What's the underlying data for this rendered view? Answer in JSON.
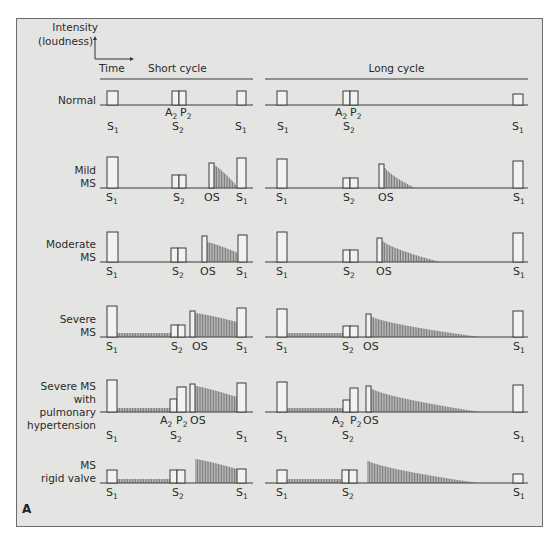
{
  "figure": {
    "panel_letter": "A",
    "axis_legend": {
      "y_label_line1": "Intensity",
      "y_label_line2": "(loudness)",
      "x_label": "Time"
    },
    "columns": [
      {
        "title": "Short cycle",
        "x0": 100,
        "x1": 253
      },
      {
        "title": "Long cycle",
        "x0": 265,
        "x1": 528
      }
    ],
    "colors": {
      "panel_bg": "#e4e4e2",
      "line": "#3a3a3a",
      "murmur": "#555555",
      "box_fill": "#f2f2f0"
    }
  },
  "chart_data": {
    "type": "diagram",
    "rows": [
      {
        "label": [
          "Normal"
        ],
        "baseline": 105,
        "short": {
          "boxes": [
            [
              107,
              118,
              14
            ],
            [
              172,
              179,
              14
            ],
            [
              179,
              186,
              14
            ],
            [
              237,
              246,
              14
            ]
          ],
          "murmurs": [],
          "marks": [
            {
              "t": "S",
              "s": "1",
              "x": 107,
              "dy": 25
            },
            {
              "t": "A",
              "s": "2",
              "x": 165,
              "dy": 11
            },
            {
              "t": "P",
              "s": "2",
              "x": 180,
              "dy": 11
            },
            {
              "t": "S",
              "s": "2",
              "x": 172,
              "dy": 25
            },
            {
              "t": "S",
              "s": "1",
              "x": 235,
              "dy": 25
            }
          ]
        },
        "long": {
          "boxes": [
            [
              277,
              287,
              14
            ],
            [
              343,
              350,
              14
            ],
            [
              350,
              358,
              14
            ],
            [
              513,
              523,
              11
            ]
          ],
          "murmurs": [],
          "marks": [
            {
              "t": "S",
              "s": "1",
              "x": 277,
              "dy": 25
            },
            {
              "t": "A",
              "s": "2",
              "x": 335,
              "dy": 11
            },
            {
              "t": "P",
              "s": "2",
              "x": 350,
              "dy": 11
            },
            {
              "t": "S",
              "s": "2",
              "x": 343,
              "dy": 25
            },
            {
              "t": "S",
              "s": "1",
              "x": 512,
              "dy": 25
            }
          ]
        }
      },
      {
        "label": [
          "Mild",
          "MS"
        ],
        "baseline": 188,
        "short": {
          "boxes": [
            [
              107,
              118,
              31
            ],
            [
              172,
              179,
              13
            ],
            [
              179,
              186,
              13
            ],
            [
              209,
              214,
              25
            ],
            [
              237,
              246,
              30
            ]
          ],
          "murmurs": [
            {
              "x0": 214,
              "x1": 236,
              "h0": 23,
              "h1": 3
            }
          ],
          "marks": [
            {
              "t": "S",
              "s": "1",
              "x": 106,
              "dy": 13
            },
            {
              "t": "S",
              "s": "2",
              "x": 173,
              "dy": 13
            },
            {
              "t": "OS",
              "s": "",
              "x": 204,
              "dy": 13
            },
            {
              "t": "S",
              "s": "1",
              "x": 236,
              "dy": 13
            }
          ]
        },
        "long": {
          "boxes": [
            [
              277,
              287,
              29
            ],
            [
              343,
              350,
              10
            ],
            [
              350,
              358,
              10
            ],
            [
              379,
              384,
              24
            ],
            [
              513,
              523,
              27
            ]
          ],
          "murmurs": [
            {
              "x0": 384,
              "x1": 415,
              "h0": 22,
              "h1": 0
            }
          ],
          "marks": [
            {
              "t": "S",
              "s": "1",
              "x": 276,
              "dy": 13
            },
            {
              "t": "S",
              "s": "2",
              "x": 343,
              "dy": 13
            },
            {
              "t": "OS",
              "s": "",
              "x": 378,
              "dy": 13
            },
            {
              "t": "S",
              "s": "1",
              "x": 513,
              "dy": 13
            }
          ]
        }
      },
      {
        "label": [
          "Moderate",
          "MS"
        ],
        "baseline": 262,
        "short": {
          "boxes": [
            [
              107,
              118,
              30
            ],
            [
              171,
              178,
              14
            ],
            [
              178,
              186,
              14
            ],
            [
              202,
              207,
              26
            ],
            [
              238,
              247,
              27
            ]
          ],
          "murmurs": [
            {
              "x0": 207,
              "x1": 238,
              "h0": 20,
              "h1": 9
            }
          ],
          "marks": [
            {
              "t": "S",
              "s": "1",
              "x": 106,
              "dy": 13
            },
            {
              "t": "S",
              "s": "2",
              "x": 172,
              "dy": 13
            },
            {
              "t": "OS",
              "s": "",
              "x": 200,
              "dy": 13
            },
            {
              "t": "S",
              "s": "1",
              "x": 236,
              "dy": 13
            }
          ]
        },
        "long": {
          "boxes": [
            [
              277,
              287,
              30
            ],
            [
              343,
              350,
              12
            ],
            [
              350,
              358,
              12
            ],
            [
              377,
              382,
              24
            ],
            [
              513,
              523,
              29
            ]
          ],
          "murmurs": [
            {
              "x0": 382,
              "x1": 440,
              "h0": 22,
              "h1": 0
            }
          ],
          "marks": [
            {
              "t": "S",
              "s": "1",
              "x": 276,
              "dy": 13
            },
            {
              "t": "S",
              "s": "2",
              "x": 343,
              "dy": 13
            },
            {
              "t": "OS",
              "s": "",
              "x": 376,
              "dy": 13
            },
            {
              "t": "S",
              "s": "1",
              "x": 513,
              "dy": 13
            }
          ]
        }
      },
      {
        "label": [
          "Severe",
          "MS"
        ],
        "baseline": 337,
        "short": {
          "boxes": [
            [
              107,
              117,
              31
            ],
            [
              171,
              178,
              12
            ],
            [
              178,
              185,
              12
            ],
            [
              190,
              195,
              26
            ],
            [
              237,
              246,
              29
            ]
          ],
          "murmurs": [
            {
              "x0": 195,
              "x1": 237,
              "h0": 24,
              "h1": 15
            },
            {
              "x0": 117,
              "x1": 171,
              "h0": 4,
              "h1": 4
            }
          ],
          "marks": [
            {
              "t": "S",
              "s": "1",
              "x": 106,
              "dy": 13
            },
            {
              "t": "S",
              "s": "2",
              "x": 171,
              "dy": 13
            },
            {
              "t": "OS",
              "s": "",
              "x": 192,
              "dy": 13
            },
            {
              "t": "S",
              "s": "1",
              "x": 236,
              "dy": 13
            }
          ]
        },
        "long": {
          "boxes": [
            [
              277,
              287,
              28
            ],
            [
              343,
              350,
              11
            ],
            [
              350,
              358,
              11
            ],
            [
              366,
              371,
              23
            ],
            [
              513,
              523,
              26
            ]
          ],
          "murmurs": [
            {
              "x0": 371,
              "x1": 480,
              "h0": 21,
              "h1": 0
            },
            {
              "x0": 287,
              "x1": 343,
              "h0": 4,
              "h1": 4
            }
          ],
          "marks": [
            {
              "t": "S",
              "s": "1",
              "x": 276,
              "dy": 13
            },
            {
              "t": "S",
              "s": "2",
              "x": 342,
              "dy": 13
            },
            {
              "t": "OS",
              "s": "",
              "x": 363,
              "dy": 13
            },
            {
              "t": "S",
              "s": "1",
              "x": 513,
              "dy": 13
            }
          ]
        }
      },
      {
        "label": [
          "Severe MS",
          "with",
          "pulmonary",
          "hypertension"
        ],
        "baseline": 412,
        "short": {
          "boxes": [
            [
              107,
              117,
              32
            ],
            [
              170,
              177,
              13
            ],
            [
              177,
              186,
              25
            ],
            [
              190,
              195,
              28
            ],
            [
              237,
              246,
              29
            ]
          ],
          "murmurs": [
            {
              "x0": 195,
              "x1": 237,
              "h0": 26,
              "h1": 15
            },
            {
              "x0": 117,
              "x1": 170,
              "h0": 4,
              "h1": 4
            }
          ],
          "marks": [
            {
              "t": "A",
              "s": "2",
              "x": 160,
              "dy": 12
            },
            {
              "t": "P",
              "s": "2",
              "x": 176,
              "dy": 12
            },
            {
              "t": "OS",
              "s": "",
              "x": 190,
              "dy": 12
            },
            {
              "t": "S",
              "s": "1",
              "x": 106,
              "dy": 27
            },
            {
              "t": "S",
              "s": "2",
              "x": 170,
              "dy": 27
            },
            {
              "t": "S",
              "s": "1",
              "x": 236,
              "dy": 27
            }
          ]
        },
        "long": {
          "boxes": [
            [
              277,
              287,
              30
            ],
            [
              343,
              350,
              12
            ],
            [
              350,
              358,
              24
            ],
            [
              366,
              371,
              26
            ],
            [
              513,
              523,
              27
            ]
          ],
          "murmurs": [
            {
              "x0": 371,
              "x1": 480,
              "h0": 24,
              "h1": 0
            },
            {
              "x0": 287,
              "x1": 343,
              "h0": 4,
              "h1": 4
            }
          ],
          "marks": [
            {
              "t": "A",
              "s": "2",
              "x": 332,
              "dy": 12
            },
            {
              "t": "P",
              "s": "2",
              "x": 350,
              "dy": 12
            },
            {
              "t": "OS",
              "s": "",
              "x": 363,
              "dy": 12
            },
            {
              "t": "S",
              "s": "1",
              "x": 276,
              "dy": 27
            },
            {
              "t": "S",
              "s": "2",
              "x": 342,
              "dy": 27
            },
            {
              "t": "S",
              "s": "1",
              "x": 513,
              "dy": 27
            }
          ]
        }
      },
      {
        "label": [
          "MS",
          "rigid valve"
        ],
        "baseline": 483,
        "short": {
          "boxes": [
            [
              107,
              117,
              13
            ],
            [
              170,
              177,
              13
            ],
            [
              177,
              185,
              13
            ],
            [
              237,
              246,
              14
            ]
          ],
          "murmurs": [
            {
              "x0": 195,
              "x1": 237,
              "h0": 24,
              "h1": 14
            },
            {
              "x0": 117,
              "x1": 170,
              "h0": 4,
              "h1": 4
            }
          ],
          "marks": [
            {
              "t": "S",
              "s": "1",
              "x": 106,
              "dy": 13
            },
            {
              "t": "S",
              "s": "2",
              "x": 172,
              "dy": 13
            },
            {
              "t": "S",
              "s": "1",
              "x": 236,
              "dy": 13
            }
          ]
        },
        "long": {
          "boxes": [
            [
              277,
              287,
              13
            ],
            [
              342,
              349,
              13
            ],
            [
              349,
              357,
              13
            ],
            [
              513,
              523,
              9
            ]
          ],
          "murmurs": [
            {
              "x0": 367,
              "x1": 478,
              "h0": 23,
              "h1": 0
            },
            {
              "x0": 287,
              "x1": 342,
              "h0": 4,
              "h1": 4
            }
          ],
          "marks": [
            {
              "t": "S",
              "s": "1",
              "x": 276,
              "dy": 13
            },
            {
              "t": "S",
              "s": "2",
              "x": 342,
              "dy": 13
            },
            {
              "t": "S",
              "s": "1",
              "x": 513,
              "dy": 13
            }
          ]
        }
      }
    ]
  }
}
